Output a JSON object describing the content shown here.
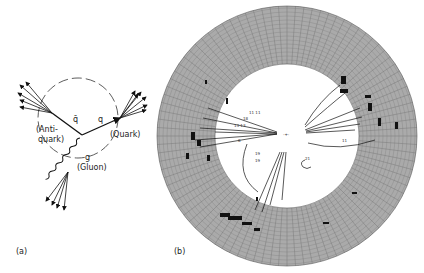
{
  "panel_a": {
    "label": "(a)",
    "antiquark_symbol": "q̄",
    "quark_symbol": "q",
    "gluon_symbol": "g",
    "antiquark_label_1": "(Anti-",
    "antiquark_label_2": "quark)",
    "quark_label": "(Quark)",
    "gluon_label": "(Gluon)"
  },
  "panel_b": {
    "label": "(b)",
    "track_labels": [
      "11 11",
      "18",
      "13 13",
      "8",
      "19",
      "19",
      "21",
      "11"
    ]
  }
}
